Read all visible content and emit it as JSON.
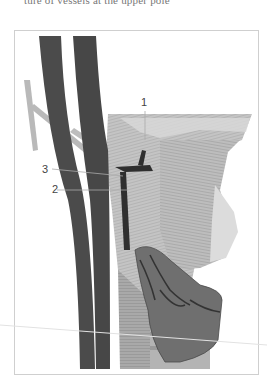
{
  "caption": "ture of vessels at the upper pole",
  "figure": {
    "labels": [
      {
        "id": "1",
        "text": "1"
      },
      {
        "id": "2",
        "text": "2"
      },
      {
        "id": "3",
        "text": "3"
      }
    ]
  },
  "colors": {
    "vessel": "#4b4b4b",
    "vessel_light": "#b9b9b9",
    "muscle": "#c8c8c8",
    "thyroid": "#6e6e6e",
    "frame": "#cfcfcf",
    "leader": "#aaaaaa"
  }
}
